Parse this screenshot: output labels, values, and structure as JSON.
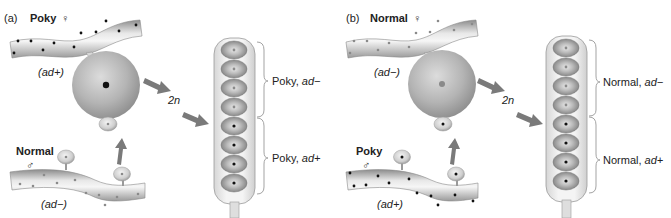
{
  "panels": [
    {
      "id": "a",
      "letter": "(a)",
      "female_strain": "Poky",
      "female_symbol": "♀",
      "female_genotype": "(ad+)",
      "male_strain": "Normal",
      "male_symbol": "♂",
      "male_genotype": "(ad−)",
      "zygote_label": "2n",
      "ascus_upper_label": "Poky, ",
      "ascus_upper_allele": "ad−",
      "ascus_lower_label": "Poky, ",
      "ascus_lower_allele": "ad+"
    },
    {
      "id": "b",
      "letter": "(b)",
      "female_strain": "Normal",
      "female_symbol": "♀",
      "female_genotype": "(ad−)",
      "male_strain": "Poky",
      "male_symbol": "♂",
      "male_genotype": "(ad+)",
      "zygote_label": "2n",
      "ascus_upper_label": "Normal, ",
      "ascus_upper_allele": "ad−",
      "ascus_lower_label": "Normal, ",
      "ascus_lower_allele": "ad+"
    }
  ],
  "colors": {
    "hypha_light": "#f2f2f2",
    "hypha_mid": "#c8c8c8",
    "hypha_dark": "#9a9a9a",
    "cell_grey": "#a8a8a8",
    "arrow_grey": "#7a7a7a",
    "poky_dot": "#111111",
    "normal_dot": "#8a8a8a"
  }
}
